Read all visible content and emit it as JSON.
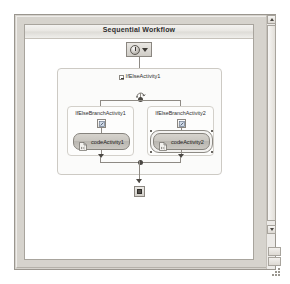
{
  "window": {
    "designer_title": "Sequential Workflow"
  },
  "nodes": {
    "start": {
      "name": "start-node",
      "icon": "clock-start-icon",
      "caret": "dropdown-caret-icon"
    },
    "end": {
      "name": "end-node",
      "icon": "stop-square-icon"
    }
  },
  "ifelse": {
    "label": "IfElseActivity1",
    "expander": "expander-minus-icon",
    "loop_icon": "condition-swirl-icon",
    "branches": [
      {
        "label": "IfElseBranchActivity1",
        "icon": "branch-condition-icon",
        "activity": {
          "label": "codeActivity1",
          "icon": "code-activity-icon",
          "selected": false
        }
      },
      {
        "label": "IfElseBranchActivity2",
        "icon": "branch-condition-icon",
        "activity": {
          "label": "codeActivity2",
          "icon": "code-activity-icon",
          "selected": true
        }
      }
    ]
  },
  "scrollbar": {
    "up_arrow": "scroll-up-arrow-icon",
    "down_arrow": "scroll-down-arrow-icon",
    "thumb": "scroll-thumb"
  },
  "corner": {
    "cell_top": "",
    "cell_bottom": "",
    "grip": "resize-grip-icon"
  },
  "colors": {
    "frame": "#d6d3cd",
    "surface": "#ffffff",
    "connector": "#8e8a84",
    "activity_fill": "#c9c6c0",
    "text": "#2f2f2f"
  }
}
